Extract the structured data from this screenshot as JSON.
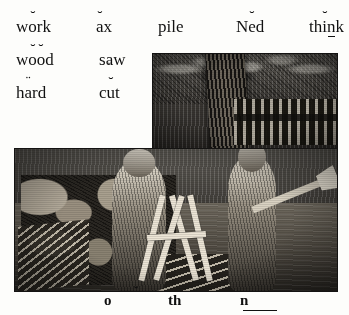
{
  "page": {
    "type": "phonics-reader-page",
    "cut_off_header": "",
    "background_color": "#fdfdfb",
    "text_color": "#111111"
  },
  "wordlist": {
    "rows": [
      {
        "words": [
          {
            "text": "wŏrk",
            "base": "work",
            "marks": "breve over o"
          },
          {
            "text": "ăx",
            "base": "ax",
            "marks": "breve over a"
          },
          {
            "text": "pile",
            "base": "pile",
            "marks": "none"
          },
          {
            "text": "Nĕd",
            "base": "Ned",
            "marks": "breve over e"
          },
          {
            "text": "thĭnk",
            "base": "think",
            "marks": "breve over i, underline under n"
          }
        ]
      },
      {
        "words": [
          {
            "text": "wŏŏd",
            "base": "wood",
            "marks": "breve over both o"
          },
          {
            "text": "sạw",
            "base": "saw",
            "marks": "mark under a"
          }
        ]
      },
      {
        "words": [
          {
            "text": "härd",
            "base": "hard",
            "marks": "diaeresis over a"
          },
          {
            "text": "cŭt",
            "base": "cut",
            "marks": "breve over u"
          }
        ]
      }
    ]
  },
  "illustration": {
    "name": "two-boys-sawing-wood-engraving",
    "caption": "",
    "description": "Wood engraving of two boys in a yard: the left boy carries a sawbuck beside a stone wall and woodpile, the right boy holds an axe; a large tree trunk and picket fence stand behind them.",
    "ink_color": "#242220",
    "shape": "L-shaped plate"
  },
  "phonograms": {
    "items": [
      {
        "text": "ŏ",
        "marks": "breve over o"
      },
      {
        "text": "th",
        "marks": "none"
      },
      {
        "text": "n",
        "marks": "underline under n"
      }
    ]
  }
}
